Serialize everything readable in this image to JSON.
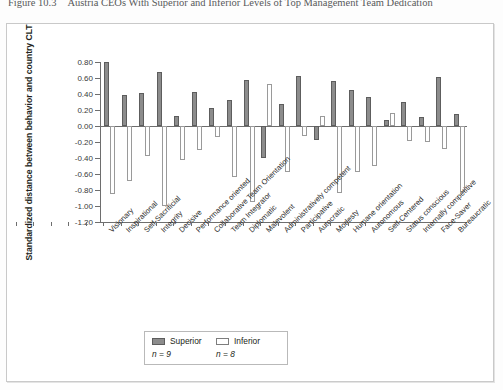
{
  "caption": {
    "figure_number": "Figure 10.3",
    "text": "Austria CEOs With Superior and Inferior Levels of Top Management Team Dedication"
  },
  "chart_data": {
    "type": "bar",
    "title": "Austria CEOs With Superior and Inferior Levels of Top Management Team Dedication",
    "xlabel": "",
    "ylabel": "Standardized distance between behavior and country CLT",
    "ylim": [
      -1.2,
      0.8
    ],
    "yticks": [
      "0.80",
      "0.60",
      "0.40",
      "0.20",
      "0.00",
      "-0.20",
      "-0.40",
      "-0.60",
      "-0.80",
      "-1.00",
      "-1.20"
    ],
    "ytick_values": [
      0.8,
      0.6,
      0.4,
      0.2,
      0.0,
      -0.2,
      -0.4,
      -0.6,
      -0.8,
      -1.0,
      -1.2
    ],
    "grid": false,
    "legend_position": "bottom",
    "categories": [
      "Visionary",
      "Inspirational",
      "Self-Sacrificial",
      "Integrity",
      "Decisive",
      "Performance oriented",
      "Collaborative Team Orientation",
      "Team Integrator",
      "Diplomatic",
      "Malevolent",
      "Administratively competent",
      "Participative",
      "Autocratic",
      "Modesty",
      "Humane orientation",
      "Autonomous",
      "Self-Centered",
      "Status conscious",
      "Internally competitive",
      "Face-Saver",
      "Bureaucratic"
    ],
    "series": [
      {
        "name": "Superior",
        "n_label": "n = 9",
        "color": "#8c8c8c",
        "values": [
          0.8,
          0.39,
          0.41,
          0.67,
          0.13,
          0.42,
          0.22,
          0.32,
          0.58,
          -0.4,
          0.28,
          0.62,
          -0.17,
          0.56,
          0.45,
          0.36,
          0.07,
          0.3,
          0.11,
          0.61,
          0.15
        ]
      },
      {
        "name": "Inferior",
        "n_label": "n = 8",
        "color": "#ffffff",
        "values": [
          -0.85,
          -0.69,
          -0.37,
          -1.0,
          -0.42,
          -0.3,
          -0.14,
          -0.64,
          -0.95,
          0.53,
          -0.57,
          -0.13,
          0.13,
          -0.84,
          -0.58,
          -0.5,
          0.16,
          -0.19,
          -0.2,
          -0.29,
          -0.83
        ]
      }
    ]
  },
  "legend": {
    "superior_label": "Superior",
    "inferior_label": "Inferior",
    "superior_n": "n = 9",
    "inferior_n": "n = 8"
  }
}
